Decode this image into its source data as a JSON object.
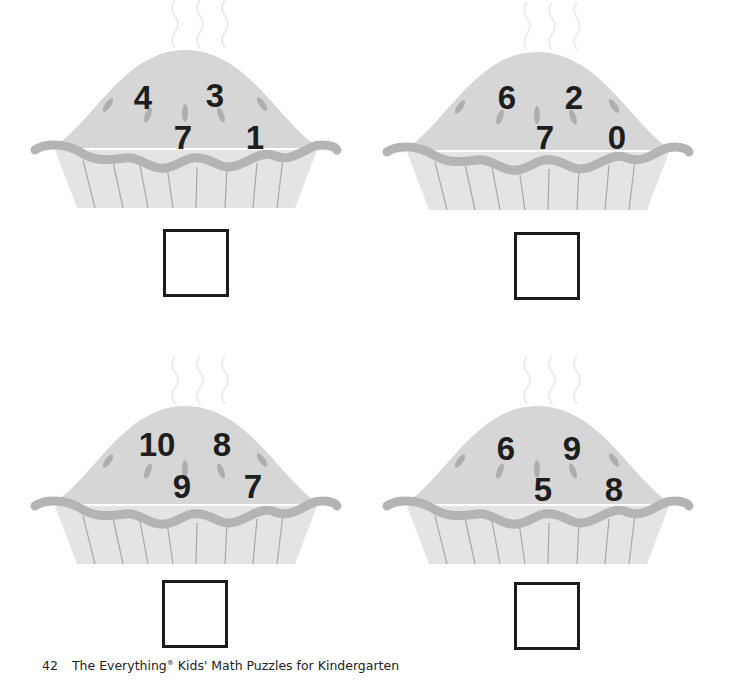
{
  "page": {
    "page_number": "42",
    "book_title_part1": "The Everything",
    "registered_mark": "®",
    "book_title_part2": " Kids' Math Puzzles for Kindergarten"
  },
  "colors": {
    "pie_top": "#d6d6d6",
    "pie_crimp": "#b4b4b4",
    "pie_tin": "#e4e4e4",
    "tin_lines": "#a8a8a8",
    "vent": "#aeaeae",
    "number_color": "#1e1e1e",
    "box_border": "#1c1c1c",
    "steam": "#ececec"
  },
  "pies": [
    {
      "id": "pie-1",
      "numbers": [
        "4",
        "3",
        "7",
        "1"
      ],
      "answer": ""
    },
    {
      "id": "pie-2",
      "numbers": [
        "6",
        "2",
        "7",
        "0"
      ],
      "answer": ""
    },
    {
      "id": "pie-3",
      "numbers": [
        "10",
        "8",
        "9",
        "7"
      ],
      "answer": ""
    },
    {
      "id": "pie-4",
      "numbers": [
        "6",
        "9",
        "5",
        "8"
      ],
      "answer": ""
    }
  ]
}
